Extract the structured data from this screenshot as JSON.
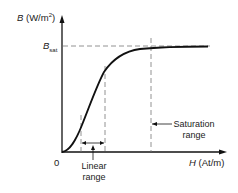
{
  "diagram": {
    "type": "B-H magnetization curve",
    "y_axis": {
      "symbol": "B",
      "unit": "(W/m",
      "unit_exp": "2",
      "unit_close": ")"
    },
    "x_axis": {
      "symbol": "H",
      "unit": "(At/m)"
    },
    "origin_label": "0",
    "saturation_level": {
      "symbol": "B",
      "subscript": "sat"
    },
    "annotations": {
      "linear_range": [
        "Linear",
        "range"
      ],
      "saturation_range": [
        "Saturation",
        "range"
      ]
    },
    "colors": {
      "line": "#111111",
      "dashed": "#666666",
      "background": "#ffffff"
    }
  }
}
